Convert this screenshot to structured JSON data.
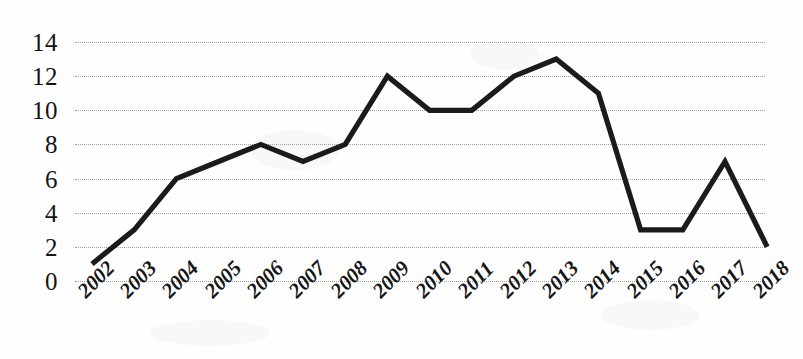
{
  "chart_data": {
    "type": "line",
    "title": "",
    "xlabel": "",
    "ylabel": "",
    "categories": [
      "2002",
      "2003",
      "2004",
      "2005",
      "2006",
      "2007",
      "2008",
      "2009",
      "2010",
      "2011",
      "2012",
      "2013",
      "2014",
      "2015",
      "2016",
      "2017",
      "2018"
    ],
    "values": [
      1,
      3,
      6,
      7,
      8,
      7,
      8,
      12,
      10,
      10,
      12,
      13,
      11,
      3,
      3,
      7,
      2
    ],
    "series": [
      {
        "name": "",
        "values": [
          1,
          3,
          6,
          7,
          8,
          7,
          8,
          12,
          10,
          10,
          12,
          13,
          11,
          3,
          3,
          7,
          2
        ]
      }
    ],
    "ylim": [
      0,
      14
    ],
    "y_ticks": [
      0,
      2,
      4,
      6,
      8,
      10,
      12,
      14
    ],
    "y_tick_labels": [
      "0",
      "2",
      "4",
      "6",
      "8",
      "10",
      "12",
      "14"
    ],
    "x_tick_labels": [
      "2002",
      "2003",
      "2004",
      "2005",
      "2006",
      "2007",
      "2008",
      "2009",
      "2010",
      "2011",
      "2012",
      "2013",
      "2014",
      "2015",
      "2016",
      "2017",
      "2018"
    ],
    "x_label_rotation_deg": -45,
    "grid": "horizontal-dotted",
    "legend": "none",
    "annotations": [],
    "line_color": "#1b1b1b",
    "gridline_color": "#9a9a9a",
    "background_color": "#fefefe",
    "markers": "none"
  }
}
